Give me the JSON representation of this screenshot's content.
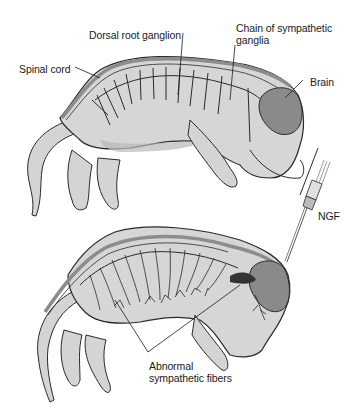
{
  "figure": {
    "panels": [
      {
        "id": "normal-embryo",
        "labels": {
          "dorsal_root_ganglion": "Dorsal root ganglion",
          "chain_line1": "Chain of sympathetic",
          "chain_line2": "ganglia",
          "spinal_cord": "Spinal cord",
          "brain": "Brain"
        }
      },
      {
        "id": "ngf-treated-embryo",
        "labels": {
          "ngf": "NGF",
          "abnormal_line1": "Abnormal",
          "abnormal_line2": "sympathetic fibers"
        }
      }
    ],
    "colors": {
      "skin": "#c9c9c9",
      "body_fill": "#d8d8d8",
      "spinal_cord": "#8c8c8c",
      "brain": "#8a8a8a",
      "outline": "#2a2a2a",
      "background": "#ffffff"
    }
  }
}
